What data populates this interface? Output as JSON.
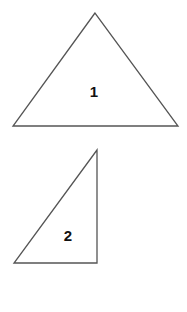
{
  "diagram": {
    "shapes": [
      {
        "id": "triangle-1",
        "type": "isosceles-triangle",
        "label": "1",
        "points": [
          [
            95,
            13
          ],
          [
            13,
            126
          ],
          [
            178,
            126
          ]
        ],
        "label_pos": [
          94,
          97
        ]
      },
      {
        "id": "triangle-2",
        "type": "right-triangle",
        "label": "2",
        "points": [
          [
            97,
            150
          ],
          [
            14,
            263
          ],
          [
            97,
            263
          ]
        ],
        "label_pos": [
          68,
          241
        ]
      }
    ],
    "stroke_color": "#555555",
    "background": "#ffffff"
  }
}
